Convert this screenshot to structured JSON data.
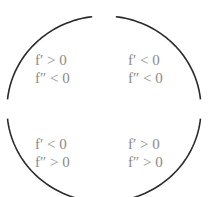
{
  "diagram": {
    "stroke_color": "#2a2a2a",
    "text_color": "#8a8a8a",
    "quadrants": [
      {
        "id": "top-left",
        "line1": "f′ > 0",
        "line2": "f″ < 0"
      },
      {
        "id": "top-right",
        "line1": "f′ < 0",
        "line2": "f″ < 0"
      },
      {
        "id": "bottom-left",
        "line1": "f′ < 0",
        "line2": "f″ > 0"
      },
      {
        "id": "bottom-right",
        "line1": "f′ > 0",
        "line2": "f″ > 0"
      }
    ]
  }
}
